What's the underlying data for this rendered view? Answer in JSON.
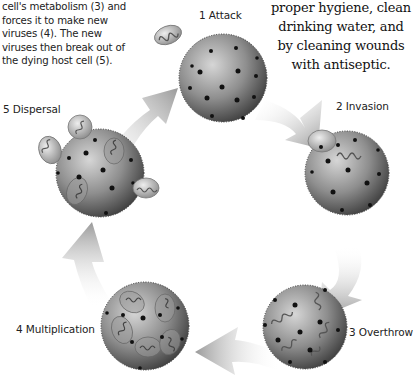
{
  "captions": {
    "left_lines": [
      "cell's metabolism (3) and",
      "forces it to make new",
      "viruses (4). The new",
      "viruses then break out of",
      "the dying host cell (5)."
    ],
    "right_lines": [
      "proper hygiene, clean",
      "drinking water, and",
      "by cleaning wounds",
      "with antiseptic."
    ]
  },
  "stages": [
    {
      "number": "1",
      "label": "1 Attack"
    },
    {
      "number": "2",
      "label": "2 Invasion"
    },
    {
      "number": "3",
      "label": "3 Overthrow"
    },
    {
      "number": "4",
      "label": "4 Multiplication"
    },
    {
      "number": "5",
      "label": "5 Dispersal"
    }
  ],
  "colors": {
    "cell_light": "#c8c8c8",
    "cell_dark": "#4a4a4a",
    "arrow": "#a8a8a8",
    "virus_shell": "#d0d0d0",
    "squiggle": "#555555"
  }
}
